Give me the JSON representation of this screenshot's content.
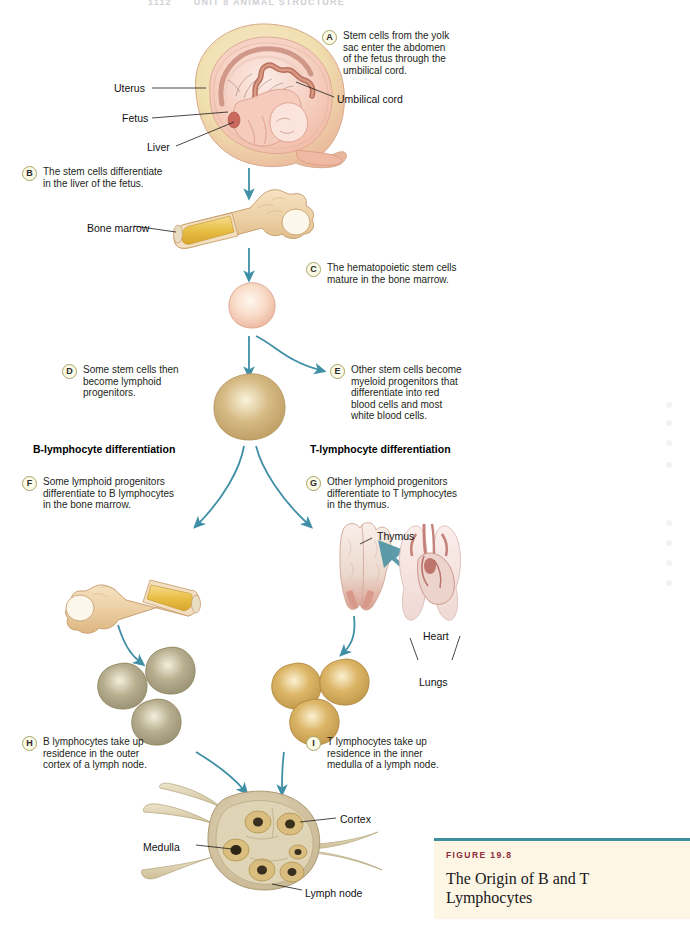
{
  "page": {
    "running_head_number": "1112",
    "running_head_title": "UNIT 8  ANIMAL STRUCTURE",
    "background_color": "#ffffff"
  },
  "palette": {
    "arrow_teal": "#3f8fa6",
    "badge_fill": "#fbfbe8",
    "badge_border": "#a8a464",
    "uterus_outer": "#f0dfae",
    "uterus_inner": "#f3b9a6",
    "fetus_body": "#f5cbbd",
    "bone_tan": "#eccfa4",
    "marrow_yellow": "#ecc34a",
    "stem_cell": "#f7d8c6",
    "lymphoid_progenitor": "#cdb07a",
    "b_lymphocyte": "#b0a98a",
    "t_lymphocyte": "#d9b466",
    "thymus": "#ecd8cd",
    "lung": "#f6e2df",
    "heart": "#c9897f",
    "lymph_node": "#d8c9a8",
    "caption_bg": "#fdf6e4",
    "caption_rule": "#3f8e9b",
    "caption_kicker": "#8c2b3a"
  },
  "steps": [
    {
      "letter": "A",
      "text": "Stem cells from the yolk\nsac enter the abdomen\nof the fetus through the\numbilical cord.",
      "left": 322,
      "top": 30
    },
    {
      "letter": "B",
      "text": "The stem cells differentiate\nin the liver of the fetus.",
      "left": 22,
      "top": 166
    },
    {
      "letter": "C",
      "text": "The hematopoietic stem cells\nmature in the bone marrow.",
      "left": 306,
      "top": 262
    },
    {
      "letter": "D",
      "text": "Some stem cells then\nbecome lymphoid\nprogenitors.",
      "left": 62,
      "top": 364
    },
    {
      "letter": "E",
      "text": "Other stem cells become\nmyeloid progenitors that\ndifferentiate into red\nblood cells and most\nwhite blood cells.",
      "left": 330,
      "top": 364
    },
    {
      "letter": "F",
      "text": "Some lymphoid progenitors\ndifferentiate to B lymphocytes\nin the bone marrow.",
      "left": 22,
      "top": 476
    },
    {
      "letter": "G",
      "text": "Other lymphoid progenitors\ndifferentiate to T lymphocytes\nin the thymus.",
      "left": 306,
      "top": 476
    },
    {
      "letter": "H",
      "text": "B lymphocytes take up\nresidence in the outer\ncortex of a lymph node.",
      "left": 22,
      "top": 736
    },
    {
      "letter": "I",
      "text": "T lymphocytes take up\nresidence in the inner\nmedulla of a lymph node.",
      "left": 306,
      "top": 736
    }
  ],
  "branch_headings": [
    {
      "label": "B-lymphocyte differentiation",
      "left": 33,
      "top": 443
    },
    {
      "label": "T-lymphocyte differentiation",
      "left": 310,
      "top": 443
    }
  ],
  "structure_labels": [
    {
      "name": "uterus",
      "label": "Uterus",
      "left": 114,
      "top": 82
    },
    {
      "name": "umbilical-cord",
      "label": "Umbilical cord",
      "left": 337,
      "top": 93
    },
    {
      "name": "fetus",
      "label": "Fetus",
      "left": 122,
      "top": 112
    },
    {
      "name": "liver",
      "label": "Liver",
      "left": 147,
      "top": 141
    },
    {
      "name": "bone-marrow",
      "label": "Bone marrow",
      "left": 87,
      "top": 222
    },
    {
      "name": "thymus",
      "label": "Thymus",
      "left": 377,
      "top": 530
    },
    {
      "name": "heart",
      "label": "Heart",
      "left": 423,
      "top": 630
    },
    {
      "name": "lungs",
      "label": "Lungs",
      "left": 419,
      "top": 676
    },
    {
      "name": "cortex",
      "label": "Cortex",
      "left": 340,
      "top": 813
    },
    {
      "name": "medulla",
      "label": "Medulla",
      "left": 143,
      "top": 841
    },
    {
      "name": "lymph-node",
      "label": "Lymph node",
      "left": 305,
      "top": 887
    }
  ],
  "caption": {
    "kicker": "FIGURE 19.8",
    "title": "The Origin of B and T Lymphocytes"
  }
}
